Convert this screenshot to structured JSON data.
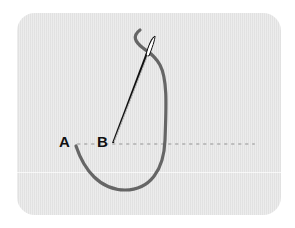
{
  "diagram": {
    "type": "sewing-stitch-illustration",
    "points": [
      {
        "id": "A",
        "label": "A"
      },
      {
        "id": "B",
        "label": "B"
      }
    ],
    "colors": {
      "fabric": "#e6e6e6",
      "thread": "#666666",
      "needle": "#111111",
      "stitch_guide": "#bcbcbc",
      "label": "#111111"
    }
  }
}
